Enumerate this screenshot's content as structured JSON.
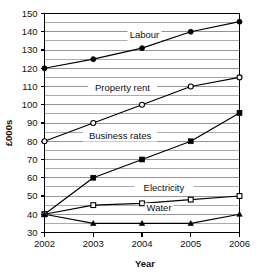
{
  "chart_data": {
    "type": "line",
    "title": "",
    "xlabel": "Year",
    "ylabel": "£000s",
    "categories": [
      "2002",
      "2003",
      "2004",
      "2005",
      "2006"
    ],
    "x": [
      2002,
      2003,
      2004,
      2005,
      2006
    ],
    "xlim": [
      2002,
      2006
    ],
    "ylim": [
      30,
      150
    ],
    "ytick_step": 10,
    "gridline_step": 5,
    "grid": true,
    "legend_position": "inline-labels",
    "yticks": [
      30,
      40,
      50,
      60,
      70,
      80,
      90,
      100,
      110,
      120,
      130,
      140,
      150
    ],
    "series": [
      {
        "name": "Labour",
        "marker": "filled-circle",
        "values": [
          120,
          125,
          131,
          140,
          145.5
        ],
        "label_x": 2004.05,
        "label_y": 136.5
      },
      {
        "name": "Property rent",
        "marker": "open-circle",
        "values": [
          80,
          90,
          100,
          110,
          115
        ],
        "label_x": 2003.6,
        "label_y": 107.5
      },
      {
        "name": "Business rates",
        "marker": "filled-square",
        "values": [
          40,
          60,
          70,
          80,
          95.5
        ],
        "label_x": 2003.55,
        "label_y": 81.5
      },
      {
        "name": "Electricity",
        "marker": "open-square",
        "values": [
          40,
          45,
          46,
          48,
          50
        ],
        "label_x": 2004.45,
        "label_y": 52.5
      },
      {
        "name": "Water",
        "marker": "filled-triangle",
        "values": [
          40,
          35,
          35,
          35,
          40
        ],
        "label_x": 2004.35,
        "label_y": 42.0
      }
    ],
    "colors": {
      "line": "#000000",
      "grid": "#888888",
      "axis": "#000000",
      "text": "#111111",
      "background": "#ffffff"
    }
  }
}
